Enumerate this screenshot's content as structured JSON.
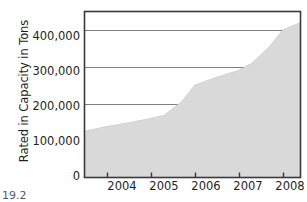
{
  "chart_data": {
    "type": "area",
    "title": "",
    "subtitle": "",
    "xlabel": "",
    "ylabel": "Rated in Capacity in Tons",
    "xlim": [
      2003.5,
      2008.4
    ],
    "ylim": [
      0,
      450000
    ],
    "grid": true,
    "legend": "none",
    "fill_color": "#d9d9d9",
    "axis_color": "#3a3a3a",
    "grid_color": "#808080",
    "text_color": "#231f20",
    "background_color": "#ffffff",
    "x_tick_labels": [
      "2004",
      "2005",
      "2006",
      "2007",
      "2008"
    ],
    "x_tick_values": [
      2004,
      2005,
      2006,
      2007,
      2008
    ],
    "y_tick_labels": [
      "0",
      "100,000",
      "200,000",
      "300,000",
      "400,000"
    ],
    "y_tick_values": [
      0,
      100000,
      200000,
      300000,
      400000
    ],
    "x": [
      2003.5,
      2004,
      2004.5,
      2005,
      2005.3,
      2005.7,
      2006,
      2006.5,
      2007,
      2007.3,
      2007.7,
      2008,
      2008.4
    ],
    "values": [
      125000,
      138000,
      148000,
      160000,
      168000,
      205000,
      250000,
      272000,
      290000,
      310000,
      355000,
      400000,
      420000
    ],
    "series": [
      {
        "name": "Rated Capacity",
        "values": [
          125000,
          138000,
          148000,
          160000,
          168000,
          205000,
          250000,
          272000,
          290000,
          310000,
          355000,
          400000,
          420000
        ]
      }
    ]
  },
  "caption": {
    "text": "19.2"
  }
}
